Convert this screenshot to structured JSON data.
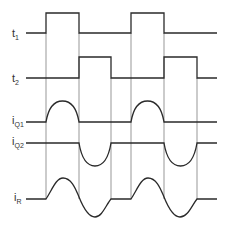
{
  "diagram": {
    "type": "timing-diagram",
    "colors": {
      "stroke": "#2a2a2a",
      "guide": "#6a6a6a",
      "background": "#ffffff"
    },
    "signals": [
      {
        "id": "t1",
        "label": "t",
        "subscript": "1",
        "shape": "square",
        "pulses": [
          [
            46,
            79
          ],
          [
            131,
            164
          ]
        ]
      },
      {
        "id": "t2",
        "label": "t",
        "subscript": "2",
        "shape": "square",
        "pulses": [
          [
            79,
            111
          ],
          [
            164,
            197
          ]
        ]
      },
      {
        "id": "iQ1",
        "label": "i",
        "subscript": "Q1",
        "shape": "positive-half-sine",
        "pulses": [
          [
            46,
            79
          ],
          [
            131,
            164
          ]
        ]
      },
      {
        "id": "iQ2",
        "label": "i",
        "subscript": "Q2",
        "shape": "negative-half-sine",
        "pulses": [
          [
            79,
            111
          ],
          [
            164,
            197
          ]
        ]
      },
      {
        "id": "iR",
        "label": "i",
        "subscript": "R",
        "shape": "full-sine",
        "pulses": [
          [
            46,
            111
          ],
          [
            131,
            197
          ]
        ]
      }
    ],
    "guides_x": [
      46,
      79,
      111,
      131,
      164,
      197
    ]
  }
}
